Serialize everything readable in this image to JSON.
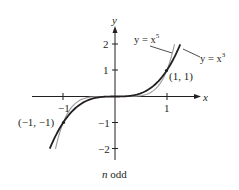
{
  "chart_data": {
    "type": "line",
    "title": "",
    "caption": "n odd",
    "caption_italic_part": "n",
    "caption_rest": " odd",
    "xlabel": "x",
    "ylabel": "y",
    "xlim": [
      -1.6,
      1.6
    ],
    "ylim": [
      -2.4,
      2.4
    ],
    "grid": false,
    "legend": "inline leader labels, upper right",
    "x_ticks": [
      {
        "value": -1,
        "label": "−1"
      },
      {
        "value": 1,
        "label": "1"
      }
    ],
    "y_ticks": [
      {
        "value": 2,
        "label": "2"
      },
      {
        "value": 1,
        "label": "1"
      },
      {
        "value": -1,
        "label": "−1"
      },
      {
        "value": -2,
        "label": "−2"
      }
    ],
    "series": [
      {
        "name": "y = x^3",
        "label_prefix": "y = x",
        "label_exp": "3",
        "color": "#231f20",
        "stroke_width": 1.8,
        "domain": [
          -1.26,
          1.26
        ],
        "x": [
          -1.26,
          -1.0,
          -0.75,
          -0.5,
          -0.25,
          0,
          0.25,
          0.5,
          0.75,
          1.0,
          1.26
        ],
        "values": [
          -2.0,
          -1.0,
          -0.42,
          -0.125,
          -0.016,
          0,
          0.016,
          0.125,
          0.42,
          1.0,
          2.0
        ]
      },
      {
        "name": "y = x^5",
        "label_prefix": "y = x",
        "label_exp": "5",
        "color": "#9a9a9a",
        "stroke_width": 1.1,
        "domain": [
          -1.149,
          1.149
        ],
        "x": [
          -1.149,
          -1.0,
          -0.75,
          -0.5,
          -0.25,
          0,
          0.25,
          0.5,
          0.75,
          1.0,
          1.149
        ],
        "values": [
          -2.0,
          -1.0,
          -0.237,
          -0.031,
          -0.001,
          0,
          0.001,
          0.031,
          0.237,
          1.0,
          2.0
        ]
      }
    ],
    "annotations": [
      {
        "type": "point",
        "x": 1,
        "y": 1,
        "label": "(1, 1)"
      },
      {
        "type": "point",
        "x": -1,
        "y": -1,
        "label": "(−1, −1)"
      }
    ]
  },
  "labels": {
    "x_axis": "x",
    "y_axis": "y",
    "point_pos": "(1, 1)",
    "point_neg": "(−1, −1)",
    "curve5_prefix": "y = x",
    "curve5_exp": "5",
    "curve3_prefix": "y = x",
    "curve3_exp": "3",
    "tick_x_neg1": "−1",
    "tick_x_1": "1",
    "tick_y_2": "2",
    "tick_y_1": "1",
    "tick_y_neg1": "−1",
    "tick_y_neg2": "−2",
    "caption_n": "n",
    "caption_rest": " odd"
  }
}
